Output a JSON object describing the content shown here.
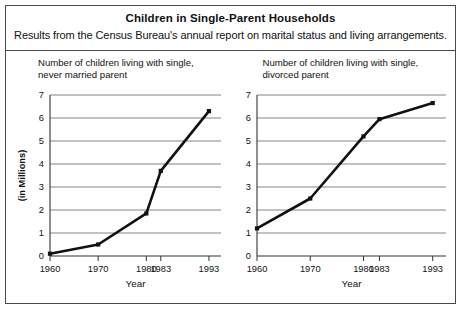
{
  "header": {
    "title": "Children in Single-Parent Households",
    "subtitle": "Results from the Census Bureau's annual report on marital status and living arrangements."
  },
  "chart_data": [
    {
      "type": "line",
      "panel": "left",
      "title": "Number of children living with single, never married parent",
      "title_line1": "Number of children living with single,",
      "title_line2": "never married parent",
      "xlabel": "Year",
      "ylabel": "(in Millions)",
      "categories": [
        "1960",
        "1970",
        "1980",
        "1983",
        "1993"
      ],
      "x": [
        1960,
        1970,
        1980,
        1983,
        1993
      ],
      "values": [
        0.1,
        0.5,
        1.85,
        3.7,
        6.3
      ],
      "ylim": [
        0,
        7
      ],
      "yticks": [
        "0",
        "1",
        "2",
        "3",
        "4",
        "5",
        "6",
        "7"
      ],
      "grid": true,
      "legend": "none",
      "marker": "square"
    },
    {
      "type": "line",
      "panel": "right",
      "title": "Number of children living with single, divorced parent",
      "title_line1": "Number of children living with single,",
      "title_line2": "divorced parent",
      "xlabel": "Year",
      "ylabel": "",
      "categories": [
        "1960",
        "1970",
        "1980",
        "1983",
        "1993"
      ],
      "x": [
        1960,
        1970,
        1980,
        1983,
        1993
      ],
      "values": [
        1.2,
        2.5,
        5.2,
        5.95,
        6.65
      ],
      "ylim": [
        0,
        7
      ],
      "yticks": [
        "0",
        "1",
        "2",
        "3",
        "4",
        "5",
        "6",
        "7"
      ],
      "grid": true,
      "legend": "none",
      "marker": "square"
    }
  ],
  "colors": {
    "line": "#111111",
    "grid": "#777777",
    "axis": "#333333",
    "border": "#4a4a4a",
    "background": "#ffffff"
  }
}
